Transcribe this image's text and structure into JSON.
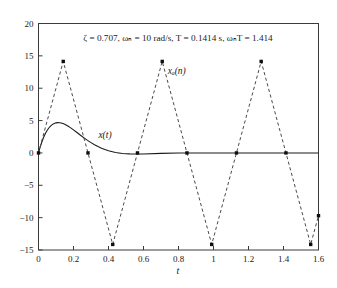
{
  "figure": {
    "title": "ζ = 0.707, ωₙ = 10 rad/s, T = 0.1414 s, ωₙT = 1.414",
    "title_parts": {
      "zeta": "ζ = 0.707",
      "omega_n": "ωₙ = 10 rad/s",
      "period": "T = 0.1414 s",
      "omega_n_T": "ωₙT = 1.414"
    },
    "background_color": "#ffffff",
    "frame_color": "#3a3a3a"
  },
  "chart_data": {
    "type": "line",
    "title": "ζ = 0.707, ωₙ = 10 rad/s, T = 0.1414 s, ωₙT = 1.414",
    "xlabel": "t",
    "ylabel": "",
    "xlim": [
      0,
      1.6
    ],
    "ylim": [
      -15,
      20
    ],
    "xticks": [
      0,
      0.2,
      0.4,
      0.6,
      0.8,
      1,
      1.2,
      1.4,
      1.6
    ],
    "xticklabels": [
      "0",
      "0.2",
      "0.4",
      "0.6",
      "0.8",
      "1",
      "1.2",
      "1.4",
      "1.6"
    ],
    "yticks": [
      -15,
      -10,
      -5,
      0,
      5,
      10,
      15,
      20
    ],
    "yticklabels": [
      "−15",
      "−10",
      "−5",
      "0",
      "5",
      "10",
      "15",
      "20"
    ],
    "grid": false,
    "legend_position": "inline-annotations",
    "annotations": [
      {
        "text": "x(t)",
        "x": 0.38,
        "y": 2.3,
        "style": "italic",
        "name": "continuous-response-label"
      },
      {
        "text": "xₐ(n)",
        "x": 0.79,
        "y": 12.2,
        "style": "italic",
        "name": "sampled-response-label"
      }
    ],
    "series": [
      {
        "name": "x(t)",
        "style": "solid",
        "color": "#1a1a1a",
        "markers": false,
        "x": [
          0.0,
          0.01,
          0.02,
          0.03,
          0.04,
          0.05,
          0.06,
          0.07,
          0.08,
          0.09,
          0.1,
          0.11,
          0.12,
          0.13,
          0.14,
          0.15,
          0.16,
          0.17,
          0.18,
          0.19,
          0.2,
          0.22,
          0.24,
          0.26,
          0.28,
          0.3,
          0.32,
          0.34,
          0.36,
          0.38,
          0.4,
          0.44,
          0.48,
          0.52,
          0.56,
          0.6,
          0.7,
          0.8,
          0.9,
          1.0,
          1.1,
          1.2,
          1.3,
          1.4,
          1.5,
          1.6
        ],
        "y": [
          0.0,
          0.95,
          1.76,
          2.45,
          3.03,
          3.51,
          3.89,
          4.19,
          4.41,
          4.56,
          4.65,
          4.68,
          4.67,
          4.62,
          4.54,
          4.42,
          4.28,
          4.12,
          3.95,
          3.76,
          3.56,
          3.15,
          2.73,
          2.33,
          1.94,
          1.59,
          1.27,
          0.98,
          0.73,
          0.52,
          0.34,
          0.07,
          -0.08,
          -0.15,
          -0.17,
          -0.16,
          -0.07,
          -0.02,
          0.0,
          0.0,
          0.0,
          0.0,
          0.0,
          0.0,
          0.0,
          0.0
        ]
      },
      {
        "name": "xₐ(n)",
        "style": "dashed",
        "color": "#4a4a4a",
        "markers": true,
        "sample_period": 0.1414,
        "x": [
          0.0,
          0.1414,
          0.2828,
          0.4242,
          0.5656,
          0.707,
          0.8484,
          0.9898,
          1.1312,
          1.2726,
          1.414,
          1.5554,
          1.6
        ],
        "y": [
          0.0,
          14.14,
          0.0,
          -14.14,
          0.0,
          14.14,
          0.0,
          -14.14,
          0.0,
          14.14,
          0.0,
          -14.14,
          -9.7
        ]
      }
    ]
  }
}
